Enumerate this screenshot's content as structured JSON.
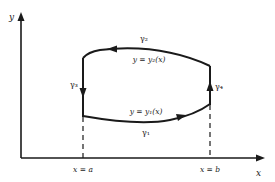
{
  "diagram": {
    "axes": {
      "x_label": "x",
      "y_label": "y"
    },
    "boundaries": {
      "left": "x = a",
      "right": "x = b"
    },
    "curves": {
      "top": {
        "name": "γ₂",
        "equation": "y = y₂(x)",
        "direction": "right-to-left"
      },
      "bottom": {
        "name": "γ₁",
        "equation": "y = y₁(x)",
        "direction": "left-to-right"
      },
      "left": {
        "name": "γ₃",
        "direction": "downward"
      },
      "right": {
        "name": "γ₄",
        "direction": "upward"
      }
    },
    "colors": {
      "stroke": "#1a1a1a",
      "background": "#ffffff"
    }
  }
}
